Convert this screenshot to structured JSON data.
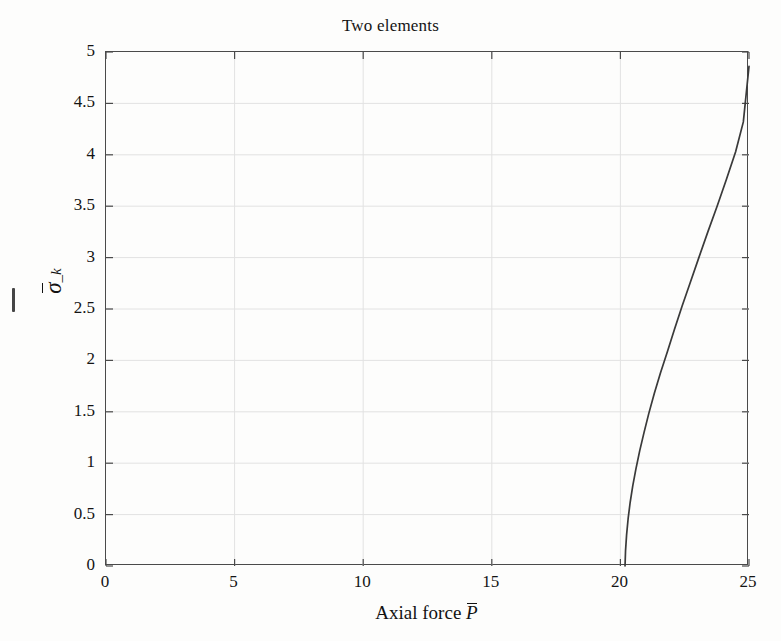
{
  "figure": {
    "title": "Two elements",
    "background_color": "#fdfdfc",
    "axis_color": "#4a4a4a",
    "grid_color": "#e2e2e2",
    "curve_color": "#3a3a3a"
  },
  "axes": {
    "x_title_prefix": "Axial force ",
    "x_title_symbol": "P",
    "x_title_full": "Axial force P̄",
    "y_title_full": "σ̄_k",
    "y_symbol": "σ",
    "y_subscript": "_k"
  },
  "chart_data": {
    "type": "line",
    "title": "Two elements",
    "xlabel": "Axial force P̄",
    "ylabel": "σ̄_k",
    "xlim": [
      0,
      25
    ],
    "ylim": [
      0,
      5
    ],
    "xticks": [
      0,
      5,
      10,
      15,
      20,
      25
    ],
    "xtick_labels": [
      "0",
      "5",
      "10",
      "15",
      "20",
      "25"
    ],
    "yticks": [
      0,
      0.5,
      1,
      1.5,
      2,
      2.5,
      3,
      3.5,
      4,
      4.5,
      5
    ],
    "ytick_labels": [
      "0",
      "0.5",
      "1",
      "1.5",
      "2",
      "2.5",
      "3",
      "3.5",
      "4",
      "4.5",
      "5"
    ],
    "grid": true,
    "legend": null,
    "series": [
      {
        "name": "bifurcation branch",
        "x": [
          20.18,
          20.2,
          20.24,
          20.3,
          20.38,
          20.48,
          20.6,
          20.75,
          20.92,
          21.1,
          21.32,
          21.56,
          21.82,
          22.1,
          22.4,
          22.72,
          23.05,
          23.4,
          23.76,
          24.12,
          24.48,
          24.78,
          25.0
        ],
        "y": [
          0.0,
          0.15,
          0.3,
          0.46,
          0.62,
          0.78,
          0.94,
          1.12,
          1.3,
          1.48,
          1.68,
          1.88,
          2.08,
          2.3,
          2.53,
          2.76,
          3.0,
          3.25,
          3.5,
          3.76,
          4.03,
          4.32,
          4.86
        ]
      }
    ]
  }
}
